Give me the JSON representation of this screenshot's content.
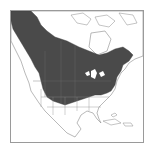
{
  "map": {
    "subject": "North America range map",
    "colors": {
      "background": "#ffffff",
      "land": "#ffffff",
      "range": "#4a4a4a",
      "border": "#8a8a8a",
      "frame": "#9a9a9a"
    },
    "regions": [
      "Canada",
      "United States",
      "Mexico",
      "Central America",
      "Caribbean"
    ]
  }
}
